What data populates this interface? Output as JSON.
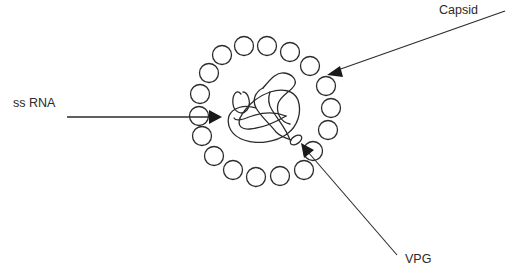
{
  "diagram": {
    "labels": {
      "capsid": "Capsid",
      "ss_rna": "ss RNA",
      "vpg": "VPG"
    },
    "components": [
      {
        "id": "capsid",
        "description": "ring of capsomere subunits (circles) forming protein shell",
        "subunit_count": 20
      },
      {
        "id": "ss_rna",
        "description": "single-stranded RNA genome drawn as tangled coil inside capsid"
      },
      {
        "id": "vpg",
        "description": "small oval protein attached to end of RNA strand"
      }
    ],
    "colors": {
      "stroke": "#2b2b2b",
      "background": "#ffffff"
    }
  }
}
